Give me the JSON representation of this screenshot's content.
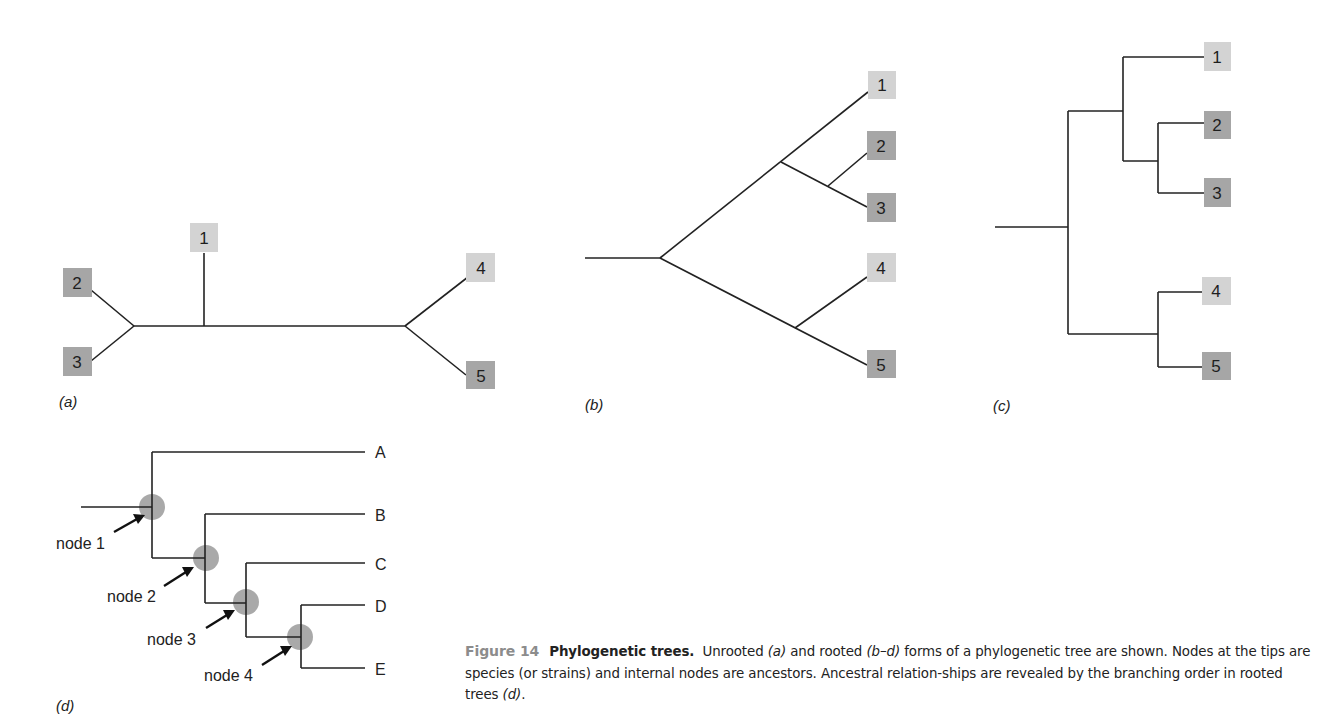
{
  "figure": {
    "number_label": "Figure 14",
    "title": "Phylogenetic trees.",
    "caption_parts": [
      {
        "text": "Unrooted ",
        "italic": false
      },
      {
        "text": "(a)",
        "italic": true
      },
      {
        "text": " and rooted ",
        "italic": false
      },
      {
        "text": "(b–d)",
        "italic": true
      },
      {
        "text": " forms of a phylogenetic tree are shown. Nodes at the tips are species (or strains) and internal nodes are ancestors. Ancestral relation-ships are revealed by the branching order in rooted trees ",
        "italic": false
      },
      {
        "text": "(d)",
        "italic": true
      },
      {
        "text": ".",
        "italic": false
      }
    ]
  },
  "colors": {
    "branch": "#222222",
    "box_light": "#d3d3d3",
    "box_dark": "#a6a6a6",
    "node_highlight": "#9a9a9a",
    "figure_number": "#8c8c8c"
  },
  "panels": {
    "a": {
      "label": "(a)",
      "type": "unrooted",
      "tips": [
        {
          "id": "1",
          "shade": "light"
        },
        {
          "id": "2",
          "shade": "dark"
        },
        {
          "id": "3",
          "shade": "dark"
        },
        {
          "id": "4",
          "shade": "light"
        },
        {
          "id": "5",
          "shade": "dark"
        }
      ]
    },
    "b": {
      "label": "(b)",
      "type": "rooted-slanted",
      "tips": [
        {
          "id": "1",
          "shade": "light"
        },
        {
          "id": "2",
          "shade": "dark"
        },
        {
          "id": "3",
          "shade": "dark"
        },
        {
          "id": "4",
          "shade": "light"
        },
        {
          "id": "5",
          "shade": "dark"
        }
      ]
    },
    "c": {
      "label": "(c)",
      "type": "rooted-rectangular",
      "tips": [
        {
          "id": "1",
          "shade": "light"
        },
        {
          "id": "2",
          "shade": "dark"
        },
        {
          "id": "3",
          "shade": "dark"
        },
        {
          "id": "4",
          "shade": "light"
        },
        {
          "id": "5",
          "shade": "dark"
        }
      ]
    },
    "d": {
      "label": "(d)",
      "type": "rooted-rectangular-annotated",
      "tips": [
        "A",
        "B",
        "C",
        "D",
        "E"
      ],
      "nodes": [
        "node 1",
        "node 2",
        "node 3",
        "node 4"
      ]
    }
  }
}
